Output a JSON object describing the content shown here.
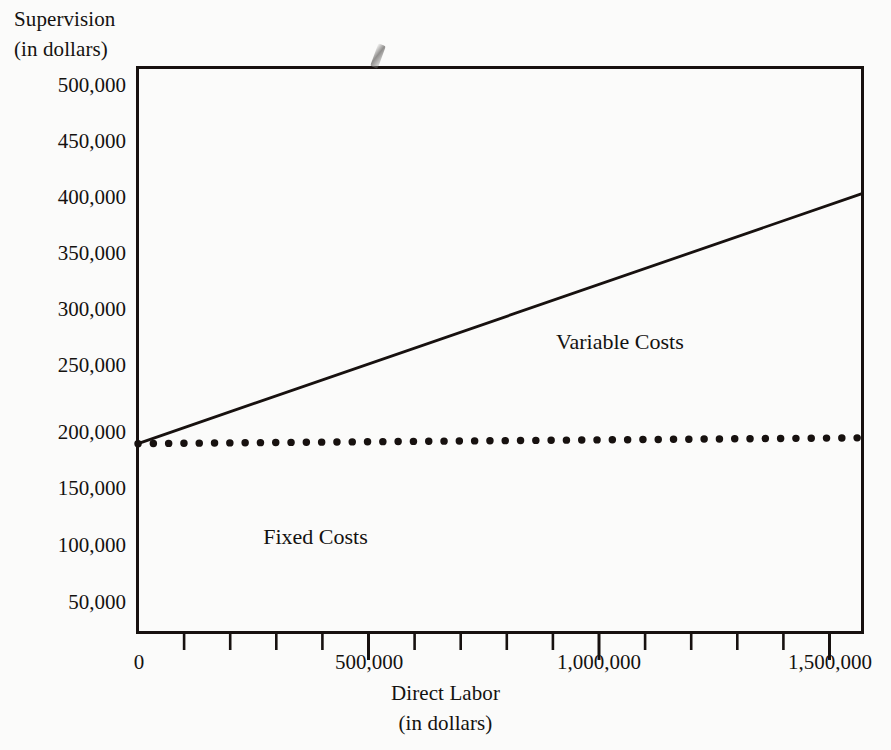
{
  "chart_data": {
    "type": "line",
    "title": "",
    "xlabel": "Direct Labor",
    "xlabel_sub": "(in dollars)",
    "ylabel": "Supervision",
    "ylabel_sub": "(in dollars)",
    "xlim": [
      0,
      1570000
    ],
    "ylim": [
      23000,
      508000
    ],
    "grid": false,
    "legend_position": "inline-annotation",
    "xticks": [
      0,
      100000,
      200000,
      300000,
      400000,
      500000,
      600000,
      700000,
      800000,
      900000,
      1000000,
      1100000,
      1200000,
      1300000,
      1400000,
      1500000
    ],
    "xtick_labels_major": [
      {
        "value": 0,
        "label": "0"
      },
      {
        "value": 500000,
        "label": "500,000"
      },
      {
        "value": 1000000,
        "label": "1,000,000"
      },
      {
        "value": 1500000,
        "label": "1,500,000"
      }
    ],
    "yticks": [
      50000,
      100000,
      150000,
      200000,
      250000,
      300000,
      350000,
      400000,
      450000,
      500000
    ],
    "ytick_labels": [
      "50,000",
      "100,000",
      "150,000",
      "200,000",
      "250,000",
      "300,000",
      "350,000",
      "400,000",
      "450,000",
      "500,000"
    ],
    "series": [
      {
        "name": "Variable Costs",
        "style": "solid",
        "color": "#17110f",
        "x": [
          0,
          1570000
        ],
        "y": [
          185000,
          400000
        ]
      },
      {
        "name": "Fixed Costs",
        "style": "dotted",
        "color": "#17110f",
        "x": [
          0,
          1570000
        ],
        "y": [
          185000,
          190000
        ]
      }
    ],
    "annotations": [
      {
        "text": "Variable Costs",
        "x": 1045000,
        "y": 272000
      },
      {
        "text": "Fixed Costs",
        "x": 385000,
        "y": 105000
      }
    ]
  },
  "axes": {
    "y_title_line1": "Supervision",
    "y_title_line2": "(in dollars)",
    "x_title_line1": "Direct Labor",
    "x_title_line2": "(in dollars)"
  },
  "ytick_labels": [
    "500,000",
    "450,000",
    "400,000",
    "350,000",
    "300,000",
    "250,000",
    "200,000",
    "150,000",
    "100,000",
    "50,000"
  ],
  "xtick_labels": [
    "0",
    "500,000",
    "1,000,000",
    "1,500,000"
  ],
  "annotations": {
    "variable_costs": "Variable Costs",
    "fixed_costs": "Fixed Costs"
  },
  "colors": {
    "ink": "#17110f",
    "paper": "#fbfbfa"
  }
}
